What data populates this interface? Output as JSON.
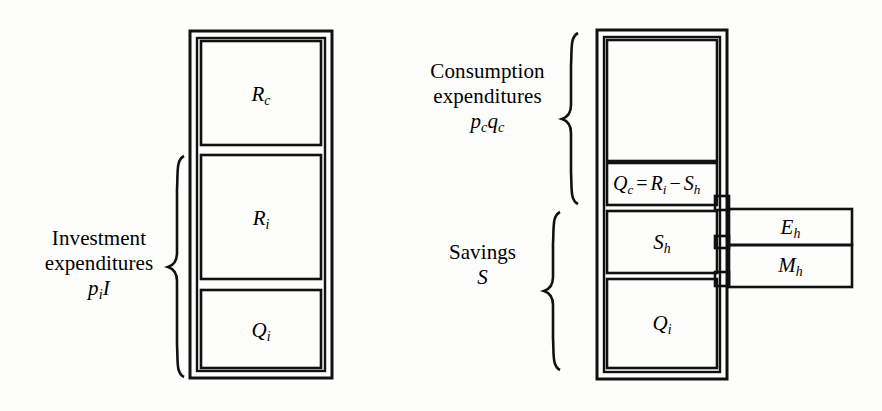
{
  "figure": {
    "type": "economic-flow-block-diagram",
    "background_color": "#fdfdfb",
    "ink_color": "#111111"
  },
  "left_column": {
    "name": "investment-column",
    "bracket_label": {
      "line1": "Investment",
      "line2": "expenditures",
      "formula_base1": "p",
      "formula_sub1": "i",
      "formula_base2": "I"
    },
    "boxes": [
      {
        "id": "R_c",
        "base": "R",
        "sub": "c"
      },
      {
        "id": "R_i",
        "base": "R",
        "sub": "i"
      },
      {
        "id": "Q_i",
        "base": "Q",
        "sub": "i"
      }
    ]
  },
  "right_column": {
    "name": "consumption-savings-column",
    "consumption_label": {
      "line1": "Consumption",
      "line2": "expenditures",
      "formula_base1": "p",
      "formula_sub1": "c",
      "formula_base2": "q",
      "formula_sub2": "c"
    },
    "savings_label": {
      "line1": "Savings",
      "line2": "S"
    },
    "boxes": [
      {
        "id": "top_empty",
        "base": "",
        "sub": ""
      },
      {
        "id": "Q_c_equation",
        "base": "Q",
        "sub": "c"
      },
      {
        "id": "S_h",
        "base": "S",
        "sub": "h"
      },
      {
        "id": "Q_i",
        "base": "Q",
        "sub": "i"
      }
    ],
    "equation": {
      "lhs_base": "Q",
      "lhs_sub": "c",
      "eq": "=",
      "term1_base": "R",
      "term1_sub": "i",
      "minus": "−",
      "term2_base": "S",
      "term2_sub": "h"
    }
  },
  "side_boxes": [
    {
      "id": "E_h",
      "base": "E",
      "sub": "h"
    },
    {
      "id": "M_h",
      "base": "M",
      "sub": "h"
    }
  ]
}
